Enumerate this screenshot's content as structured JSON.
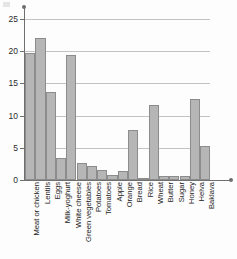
{
  "chart_data": {
    "type": "bar",
    "title": "",
    "subtitle": "",
    "xlabel": "",
    "ylabel": "",
    "ylim": [
      0,
      27
    ],
    "yticks": [
      0,
      5,
      10,
      15,
      20,
      25
    ],
    "ytick_labels": [
      "0",
      "5",
      "10",
      "15",
      "20",
      "25"
    ],
    "grid": "horizontal",
    "legend": "none",
    "orientation": "vertical",
    "bar_color": "#b6b6b6",
    "bar_edge_color": "#8c8c8c",
    "axis_color": "#6f6f6f",
    "gridline_color": "#c3c3c3",
    "categories": [
      "Meat or chicken",
      "Lentils",
      "Eggs",
      "Milk-yoghurt",
      "White cheese",
      "Green vegetables",
      "Potatoes",
      "Tomatoes",
      "Apple",
      "Orange",
      "Bread",
      "Rice",
      "Wheat",
      "Butter",
      "Sugar",
      "Honey",
      "Helva",
      "Baklava"
    ],
    "values": [
      19.7,
      22.1,
      13.7,
      3.4,
      19.4,
      2.6,
      2.1,
      1.5,
      0.8,
      1.4,
      7.7,
      0.2,
      11.7,
      0.6,
      0.6,
      0.6,
      12.6,
      5.3
    ]
  }
}
